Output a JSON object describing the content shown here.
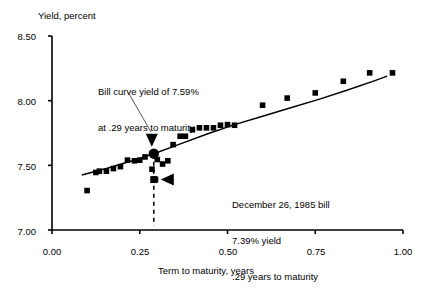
{
  "chart_data": {
    "type": "scatter",
    "title": "",
    "xlabel": "Term to maturity, years",
    "ylabel": "Yield, percent",
    "xlim": [
      0.0,
      1.0
    ],
    "ylim": [
      7.0,
      8.5
    ],
    "xticks": [
      "0.00",
      "0.25",
      "0.50",
      "0.75",
      "1.00"
    ],
    "xtick_values": [
      0.0,
      0.25,
      0.5,
      0.75,
      1.0
    ],
    "yticks": [
      "7.00",
      "7.50",
      "8.00",
      "8.50"
    ],
    "ytick_values": [
      7.0,
      7.5,
      8.0,
      8.5
    ],
    "grid": false,
    "legend": "none",
    "series": [
      {
        "name": "Bill yields",
        "marker": "square",
        "color": "#000000",
        "points": [
          [
            0.1,
            7.305
          ],
          [
            0.125,
            7.445
          ],
          [
            0.135,
            7.455
          ],
          [
            0.155,
            7.455
          ],
          [
            0.175,
            7.475
          ],
          [
            0.195,
            7.49
          ],
          [
            0.215,
            7.54
          ],
          [
            0.235,
            7.535
          ],
          [
            0.25,
            7.54
          ],
          [
            0.265,
            7.565
          ],
          [
            0.285,
            7.47
          ],
          [
            0.295,
            7.39
          ],
          [
            0.3,
            7.545
          ],
          [
            0.315,
            7.51
          ],
          [
            0.33,
            7.535
          ],
          [
            0.345,
            7.66
          ],
          [
            0.365,
            7.725
          ],
          [
            0.38,
            7.725
          ],
          [
            0.4,
            7.775
          ],
          [
            0.42,
            7.79
          ],
          [
            0.44,
            7.79
          ],
          [
            0.46,
            7.79
          ],
          [
            0.48,
            7.81
          ],
          [
            0.5,
            7.815
          ],
          [
            0.52,
            7.81
          ],
          [
            0.6,
            7.965
          ],
          [
            0.67,
            8.02
          ],
          [
            0.75,
            8.06
          ],
          [
            0.83,
            8.15
          ],
          [
            0.905,
            8.215
          ],
          [
            0.97,
            8.215
          ]
        ]
      },
      {
        "name": "Fitted bill curve",
        "type": "line",
        "color": "#000000",
        "points": [
          [
            0.085,
            7.425
          ],
          [
            0.16,
            7.48
          ],
          [
            0.24,
            7.545
          ],
          [
            0.29,
            7.59
          ],
          [
            0.36,
            7.66
          ],
          [
            0.44,
            7.74
          ],
          [
            0.52,
            7.815
          ],
          [
            0.6,
            7.88
          ],
          [
            0.68,
            7.945
          ],
          [
            0.76,
            8.01
          ],
          [
            0.84,
            8.08
          ],
          [
            0.92,
            8.155
          ],
          [
            0.955,
            8.19
          ]
        ]
      }
    ],
    "highlight_point": {
      "name": "bill-curve-yield-point",
      "x": 0.29,
      "y": 7.59,
      "marker": "circle"
    },
    "marked_point": {
      "name": "december-26-1985-bill-point",
      "x": 0.29,
      "y": 7.39,
      "marker": "square"
    },
    "dashed_line": {
      "name": "maturity-dropline",
      "x": 0.29,
      "y_from": 7.59,
      "y_to": 7.03
    },
    "annotations": [
      {
        "name": "bill-curve-annotation",
        "lines": [
          "Bill curve yield of 7.59%",
          "at .29 years to maturity"
        ],
        "arrow": "down",
        "points_to": [
          0.29,
          7.59
        ]
      },
      {
        "name": "december-bill-annotation",
        "lines": [
          "December 26, 1985 bill",
          "7.39% yield",
          ".29 years to maturity"
        ],
        "arrow": "left",
        "points_to": [
          0.29,
          7.39
        ]
      }
    ]
  },
  "axes": {
    "y_title": "Yield, percent",
    "x_title": "Term to maturity, years"
  }
}
